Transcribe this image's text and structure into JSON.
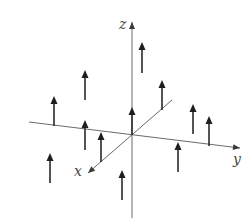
{
  "diagram": {
    "title": "",
    "colors": {
      "background": "#ffffff",
      "axis": "#6a6a6a",
      "vector": "#1e1e1e",
      "label": "#444444"
    },
    "origin": {
      "x": 132,
      "y": 135
    },
    "axes": [
      {
        "name": "z",
        "label": "z",
        "from": [
          132,
          218
        ],
        "to": [
          132,
          22
        ],
        "label_pos": [
          119,
          29
        ]
      },
      {
        "name": "y",
        "label": "y",
        "from": [
          29,
          122
        ],
        "to": [
          240,
          148
        ],
        "label_pos": [
          233,
          164
        ]
      },
      {
        "name": "x",
        "label": "x",
        "from": [
          172,
          100
        ],
        "to": [
          88,
          173
        ],
        "label_pos": [
          74,
          176
        ]
      }
    ],
    "vectors": [
      {
        "base": [
          142,
          73
        ],
        "tip": [
          142,
          42
        ]
      },
      {
        "base": [
          85,
          100
        ],
        "tip": [
          85,
          70
        ]
      },
      {
        "base": [
          162,
          110
        ],
        "tip": [
          162,
          80
        ]
      },
      {
        "base": [
          54,
          126
        ],
        "tip": [
          54,
          96
        ]
      },
      {
        "base": [
          132,
          135
        ],
        "tip": [
          132,
          107
        ]
      },
      {
        "base": [
          193,
          134
        ],
        "tip": [
          193,
          104
        ]
      },
      {
        "base": [
          209,
          146
        ],
        "tip": [
          209,
          116
        ]
      },
      {
        "base": [
          85,
          150
        ],
        "tip": [
          85,
          120
        ]
      },
      {
        "base": [
          101,
          162
        ],
        "tip": [
          101,
          132
        ]
      },
      {
        "base": [
          50,
          183
        ],
        "tip": [
          50,
          153
        ]
      },
      {
        "base": [
          178,
          172
        ],
        "tip": [
          178,
          142
        ]
      },
      {
        "base": [
          122,
          200
        ],
        "tip": [
          122,
          170
        ]
      }
    ]
  }
}
